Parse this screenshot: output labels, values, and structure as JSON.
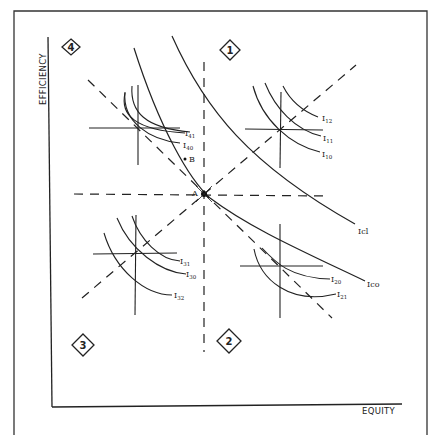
{
  "diagram": {
    "axes": {
      "y_label": "EFFICIENCY",
      "x_label": "EQUITY"
    },
    "quadrants": [
      {
        "id": "1",
        "label": "1",
        "position": "top-right"
      },
      {
        "id": "2",
        "label": "2",
        "position": "bottom-right"
      },
      {
        "id": "3",
        "label": "3",
        "position": "bottom-left"
      },
      {
        "id": "4",
        "label": "4",
        "position": "top-left"
      }
    ],
    "points": {
      "A": "A",
      "B": "B"
    },
    "contract_curves": {
      "Ic0": "Ico",
      "Ic1": "Icl"
    },
    "indifference_labels": {
      "q1": [
        "I12",
        "I11",
        "I10"
      ],
      "q2": [
        "I20",
        "I21"
      ],
      "q3": [
        "I31",
        "I30",
        "I32"
      ],
      "q4": [
        "I41",
        "I40"
      ]
    },
    "colors": {
      "line": "#222222",
      "frame": "#333333",
      "background": "#ffffff"
    }
  }
}
